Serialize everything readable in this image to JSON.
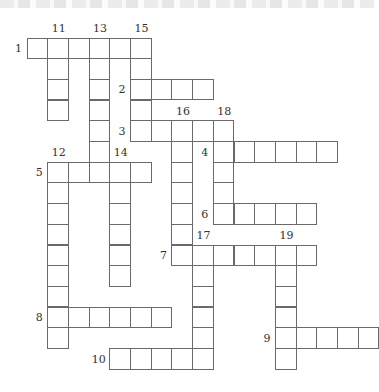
{
  "puzzle": {
    "type": "crossword",
    "origin": {
      "x": 27,
      "y": 38
    },
    "cell_size": 20.7,
    "colors": {
      "line": "#6a6a6a",
      "cell": "#ffffff",
      "label": "#333333"
    },
    "across": [
      {
        "number": "1",
        "row": 0,
        "col": 0,
        "length": 6
      },
      {
        "number": "2",
        "row": 2,
        "col": 5,
        "length": 4
      },
      {
        "number": "3",
        "row": 4,
        "col": 5,
        "length": 5
      },
      {
        "number": "4",
        "row": 5,
        "col": 9,
        "length": 6
      },
      {
        "number": "5",
        "row": 6,
        "col": 1,
        "length": 5
      },
      {
        "number": "6",
        "row": 8,
        "col": 9,
        "length": 5
      },
      {
        "number": "7",
        "row": 10,
        "col": 7,
        "length": 7
      },
      {
        "number": "8",
        "row": 13,
        "col": 1,
        "length": 6
      },
      {
        "number": "9",
        "row": 14,
        "col": 12,
        "length": 5
      },
      {
        "number": "10",
        "row": 15,
        "col": 4,
        "length": 5
      }
    ],
    "down": [
      {
        "number": "11",
        "row": 0,
        "col": 1,
        "length": 4
      },
      {
        "number": "12",
        "row": 6,
        "col": 1,
        "length": 9
      },
      {
        "number": "13",
        "row": 0,
        "col": 3,
        "length": 7
      },
      {
        "number": "14",
        "row": 6,
        "col": 4,
        "length": 6
      },
      {
        "number": "15",
        "row": 0,
        "col": 5,
        "length": 5
      },
      {
        "number": "16",
        "row": 4,
        "col": 7,
        "length": 7
      },
      {
        "number": "17",
        "row": 10,
        "col": 8,
        "length": 6
      },
      {
        "number": "18",
        "row": 4,
        "col": 9,
        "length": 5
      },
      {
        "number": "19",
        "row": 10,
        "col": 12,
        "length": 6
      }
    ]
  }
}
